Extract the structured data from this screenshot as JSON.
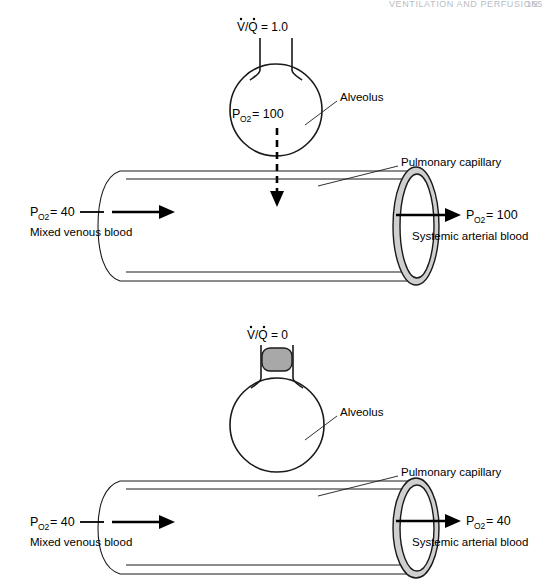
{
  "page": {
    "header_running_title": "VENTILATION AND PERFUSION",
    "header_page_number": "165",
    "width": 553,
    "height": 581
  },
  "colors": {
    "ink": "#1a1a1a",
    "plug_gray": "#a8a8a8",
    "ring_gray": "#cfcfcf",
    "paper": "#ffffff",
    "header_gray": "#b9bcc4"
  },
  "panels": [
    {
      "id": "panel-normal",
      "name": "normal-ventilation-perfusion",
      "ratio_label": "V/Q = 1.0",
      "ratio_numerator": "V",
      "ratio_denominator": "Q",
      "ratio_value": "1.0",
      "alveolus_label": "Alveolus",
      "alveolus_po2_prefix": "P",
      "alveolus_po2_subscript": "O",
      "alveolus_po2_subscript2": "2",
      "alveolus_po2_value": "= 100",
      "alveolus_po2_full": "PO2 = 100",
      "capillary_label": "Pulmonary capillary",
      "inflow_po2_prefix": "P",
      "inflow_po2_value": "= 40",
      "inflow_blood_label": "Mixed venous blood",
      "outflow_po2_prefix": "P",
      "outflow_po2_value": "= 100",
      "outflow_blood_label": "Systemic arterial blood",
      "airway_open": true,
      "diffusion_arrow": "downward-dashed"
    },
    {
      "id": "panel-shunt",
      "name": "shunt-zero-ventilation-perfusion",
      "ratio_label": "V/Q = 0",
      "ratio_numerator": "V",
      "ratio_denominator": "Q",
      "ratio_value": "0",
      "alveolus_label": "Alveolus",
      "alveolus_po2_full": "",
      "capillary_label": "Pulmonary capillary",
      "inflow_po2_prefix": "P",
      "inflow_po2_value": "= 40",
      "inflow_blood_label": "Mixed venous blood",
      "outflow_po2_prefix": "P",
      "outflow_po2_value": "= 40",
      "outflow_blood_label": "Systemic arterial blood",
      "airway_open": false,
      "airway_block_name": "airway-obstruction-plug",
      "diffusion_arrow": "none"
    }
  ],
  "subscript": {
    "o": "O",
    "two": "2"
  }
}
